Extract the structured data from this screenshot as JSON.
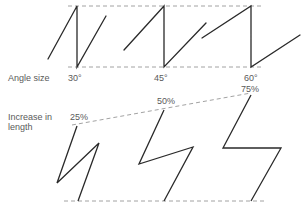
{
  "labels": {
    "angle_size": "Angle size",
    "increase_line1": "Increase in",
    "increase_line2": "length"
  },
  "angles": [
    "30°",
    "45°",
    "60°"
  ],
  "increases": [
    "25%",
    "50%",
    "75%"
  ],
  "colors": {
    "stroke": "#2a2a2a",
    "dash": "#8a8a8a",
    "text": "#5a5a5a"
  }
}
